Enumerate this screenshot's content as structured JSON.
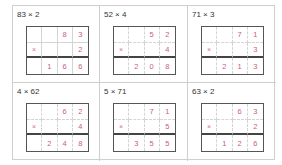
{
  "colors": {
    "digit": "#c8607c",
    "grid_border": "#555555",
    "divider": "#d4d4d4",
    "result_line": "#444444",
    "title": "#333333",
    "card_border": "#cfcfcf"
  },
  "cards": [
    {
      "title": "83 × 2",
      "divider_style": "solid",
      "rows": [
        [
          "",
          "",
          "8",
          "3"
        ],
        [
          "×",
          "",
          "",
          "2"
        ],
        [
          "",
          "1",
          "6",
          "6"
        ]
      ]
    },
    {
      "title": "52 × 4",
      "divider_style": "dashed",
      "rows": [
        [
          "",
          "",
          "5",
          "2"
        ],
        [
          "×",
          "",
          "",
          "4"
        ],
        [
          "",
          "2",
          "0",
          "8"
        ]
      ]
    },
    {
      "title": "71 × 3",
      "divider_style": "dashed",
      "rows": [
        [
          "",
          "",
          "7",
          "1"
        ],
        [
          "×",
          "",
          "",
          "3"
        ],
        [
          "",
          "2",
          "1",
          "3"
        ]
      ]
    },
    {
      "title": "4 × 62",
      "divider_style": "dashed",
      "rows": [
        [
          "",
          "",
          "6",
          "2"
        ],
        [
          "×",
          "",
          "",
          "4"
        ],
        [
          "",
          "2",
          "4",
          "8"
        ]
      ]
    },
    {
      "title": "5 × 71",
      "divider_style": "dashed",
      "rows": [
        [
          "",
          "",
          "7",
          "1"
        ],
        [
          "×",
          "",
          "",
          "5"
        ],
        [
          "",
          "3",
          "5",
          "5"
        ]
      ]
    },
    {
      "title": "63 × 2",
      "divider_style": "dashed",
      "rows": [
        [
          "",
          "",
          "6",
          "3"
        ],
        [
          "×",
          "",
          "",
          "2"
        ],
        [
          "",
          "1",
          "2",
          "6"
        ]
      ]
    }
  ]
}
